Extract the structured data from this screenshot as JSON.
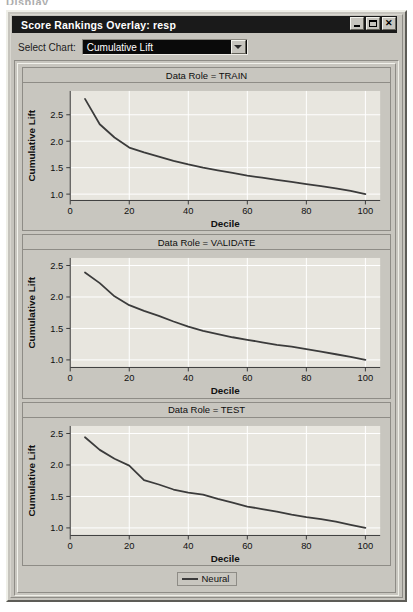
{
  "ghost_top_text": "Display",
  "window": {
    "title": "Score Rankings Overlay: resp",
    "controls": {
      "minimize": "minimize-button",
      "maximize": "maximize-button",
      "close": "close-button"
    }
  },
  "toolbar": {
    "select_chart_label": "Select Chart:",
    "selected_chart": "Cumulative Lift",
    "chart_options": [
      "Cumulative Lift"
    ]
  },
  "legend": {
    "entries": [
      {
        "label": "Neural",
        "color": "#3b3b3b"
      }
    ]
  },
  "colors": {
    "window_face": "#c6c4bd",
    "plot_face": "#e8e6df",
    "grid": "#ffffff",
    "axis": "#3a3a3a",
    "series": "#3b3b3b",
    "titlebar": "#1a1a1a"
  },
  "chart_data": [
    {
      "type": "line",
      "title": "Data Role = TRAIN",
      "xlabel": "Decile",
      "ylabel": "Cumulative Lift",
      "xlim": [
        0,
        105
      ],
      "ylim": [
        0.88,
        2.95
      ],
      "xticks": [
        0,
        20,
        40,
        60,
        80,
        100
      ],
      "yticks": [
        1.0,
        1.5,
        2.0,
        2.5
      ],
      "ytick_labels": [
        "1.0",
        "1.5",
        "2.0",
        "2.5"
      ],
      "grid": true,
      "legend_position": "bottom",
      "series": [
        {
          "name": "Neural",
          "color": "#3b3b3b",
          "x": [
            5,
            10,
            15,
            20,
            25,
            30,
            35,
            40,
            45,
            50,
            55,
            60,
            65,
            70,
            75,
            80,
            85,
            90,
            95,
            100
          ],
          "values": [
            2.8,
            2.32,
            2.07,
            1.88,
            1.79,
            1.71,
            1.63,
            1.56,
            1.5,
            1.45,
            1.4,
            1.35,
            1.31,
            1.27,
            1.23,
            1.19,
            1.15,
            1.11,
            1.06,
            1.0
          ]
        }
      ]
    },
    {
      "type": "line",
      "title": "Data Role = VALIDATE",
      "xlabel": "Decile",
      "ylabel": "Cumulative Lift",
      "xlim": [
        0,
        105
      ],
      "ylim": [
        0.88,
        2.62
      ],
      "xticks": [
        0,
        20,
        40,
        60,
        80,
        100
      ],
      "yticks": [
        1.0,
        1.5,
        2.0,
        2.5
      ],
      "ytick_labels": [
        "1.0",
        "1.5",
        "2.0",
        "2.5"
      ],
      "grid": true,
      "legend_position": "bottom",
      "series": [
        {
          "name": "Neural",
          "color": "#3b3b3b",
          "x": [
            5,
            10,
            15,
            20,
            25,
            30,
            35,
            40,
            45,
            50,
            55,
            60,
            65,
            70,
            75,
            80,
            85,
            90,
            95,
            100
          ],
          "values": [
            2.39,
            2.22,
            2.01,
            1.87,
            1.78,
            1.7,
            1.61,
            1.53,
            1.46,
            1.41,
            1.36,
            1.32,
            1.28,
            1.24,
            1.21,
            1.17,
            1.13,
            1.09,
            1.05,
            1.0
          ]
        }
      ]
    },
    {
      "type": "line",
      "title": "Data Role = TEST",
      "xlabel": "Decile",
      "ylabel": "Cumulative Lift",
      "xlim": [
        0,
        105
      ],
      "ylim": [
        0.88,
        2.62
      ],
      "xticks": [
        0,
        20,
        40,
        60,
        80,
        100
      ],
      "yticks": [
        1.0,
        1.5,
        2.0,
        2.5
      ],
      "ytick_labels": [
        "1.0",
        "1.5",
        "2.0",
        "2.5"
      ],
      "grid": true,
      "legend_position": "bottom",
      "series": [
        {
          "name": "Neural",
          "color": "#3b3b3b",
          "x": [
            5,
            10,
            15,
            20,
            25,
            30,
            35,
            40,
            45,
            50,
            55,
            60,
            65,
            70,
            75,
            80,
            85,
            90,
            95,
            100
          ],
          "values": [
            2.44,
            2.24,
            2.1,
            1.99,
            1.76,
            1.69,
            1.61,
            1.56,
            1.53,
            1.46,
            1.4,
            1.34,
            1.3,
            1.26,
            1.21,
            1.17,
            1.14,
            1.1,
            1.05,
            1.0
          ]
        }
      ]
    }
  ]
}
